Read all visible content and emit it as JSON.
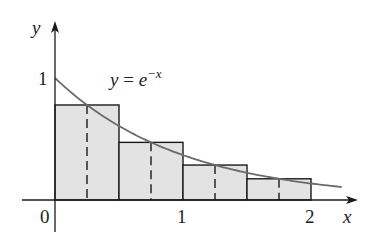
{
  "chart_data": {
    "type": "bar",
    "title": "",
    "curve": {
      "label_prefix": "y = e",
      "label_exponent": "−x",
      "function": "exp(-x)",
      "x_range": [
        0,
        2.24
      ]
    },
    "categories": [
      "[0, 0.5]",
      "[0.5, 1]",
      "[1, 1.5]",
      "[1.5, 2]"
    ],
    "x_left": [
      0,
      0.5,
      1,
      1.5
    ],
    "width": 0.5,
    "midpoints": [
      0.25,
      0.75,
      1.25,
      1.75
    ],
    "values": [
      0.7788,
      0.4724,
      0.2865,
      0.1738
    ],
    "xlabel": "x",
    "ylabel": "y",
    "x_ticks": [
      "0",
      "1",
      "2"
    ],
    "y_ticks": [
      "1"
    ],
    "xlim": [
      0,
      2.35
    ],
    "ylim": [
      0,
      1.4
    ],
    "grid": false,
    "legend": "none",
    "colors": {
      "fill": "#e3e3e3",
      "edge": "#1a1a1a",
      "curve": "#6b6b6b"
    }
  }
}
